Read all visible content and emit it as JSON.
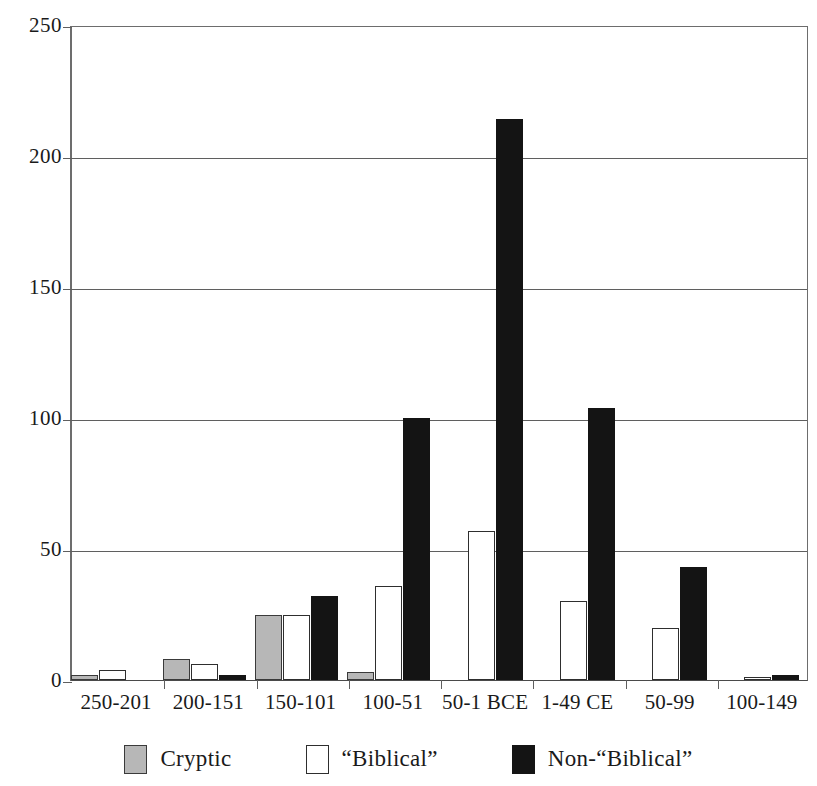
{
  "chart_data": {
    "type": "bar",
    "title": "",
    "xlabel": "",
    "ylabel": "",
    "ylim": [
      0,
      250
    ],
    "yticks": [
      0,
      50,
      100,
      150,
      200,
      250
    ],
    "grid": true,
    "legend_position": "bottom",
    "categories": [
      "250-201",
      "200-151",
      "150-101",
      "100-51",
      "50-1 BCE",
      "1-49 CE",
      "50-99",
      "100-149"
    ],
    "series": [
      {
        "name": "Cryptic",
        "color": "#b7b7b7",
        "values": [
          2,
          8,
          25,
          3,
          0,
          0,
          0,
          0
        ]
      },
      {
        "name": "“Biblical”",
        "color": "#ffffff",
        "values": [
          4,
          6,
          25,
          36,
          57,
          30,
          20,
          1
        ]
      },
      {
        "name": "Non-“Biblical”",
        "color": "#141414",
        "values": [
          0,
          2,
          32,
          100,
          214,
          104,
          43,
          2
        ]
      }
    ]
  },
  "axis": {
    "y_tick_labels": [
      "0",
      "50",
      "100",
      "150",
      "200",
      "250"
    ]
  },
  "legend": {
    "items": [
      {
        "label": "Cryptic",
        "swatch": "cryptic"
      },
      {
        "label": "“Biblical”",
        "swatch": "biblical"
      },
      {
        "label": "Non-“Biblical”",
        "swatch": "nonbiblical"
      }
    ]
  },
  "header": {
    "clipped_title": ""
  }
}
